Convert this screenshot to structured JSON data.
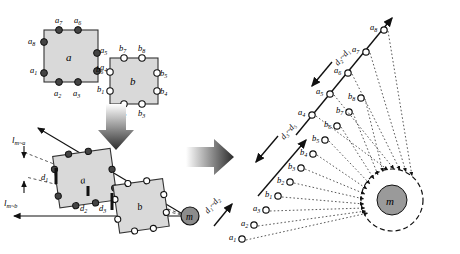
{
  "figure": {
    "background": "#ffffff",
    "fill_square": "#d9d9d9",
    "stroke": "#1a1a1a",
    "node_fill": "#8c8c8c"
  },
  "square_a": {
    "label": "a",
    "marker_style": "filled",
    "points": [
      {
        "id": "a1",
        "label": "a",
        "sub": "1"
      },
      {
        "id": "a2",
        "label": "a",
        "sub": "2"
      },
      {
        "id": "a3",
        "label": "a",
        "sub": "3"
      },
      {
        "id": "a4",
        "label": "a",
        "sub": "4"
      },
      {
        "id": "a5",
        "label": "a",
        "sub": "5"
      },
      {
        "id": "a6",
        "label": "a",
        "sub": "6"
      },
      {
        "id": "a7",
        "label": "a",
        "sub": "7"
      },
      {
        "id": "a8",
        "label": "a",
        "sub": "8"
      }
    ]
  },
  "square_b": {
    "label": "b",
    "marker_style": "hollow",
    "points": [
      {
        "id": "b1",
        "label": "b",
        "sub": "1"
      },
      {
        "id": "b2",
        "label": "b",
        "sub": "2"
      },
      {
        "id": "b3",
        "label": "b",
        "sub": "3"
      },
      {
        "id": "b4",
        "label": "b",
        "sub": "4"
      },
      {
        "id": "b5",
        "label": "b",
        "sub": "5"
      },
      {
        "id": "b6",
        "label": "b",
        "sub": "6"
      },
      {
        "id": "b7",
        "label": "b",
        "sub": "7"
      },
      {
        "id": "b8",
        "label": "b",
        "sub": "8"
      }
    ]
  },
  "middle_panel": {
    "line_labels": [
      {
        "id": "l_ma",
        "label": "l",
        "sub": "m~a",
        "arrow": "down"
      },
      {
        "id": "l_mb",
        "label": "l",
        "sub": "m~b",
        "arrow": "up"
      }
    ],
    "distance_labels": [
      {
        "id": "d1",
        "label": "d",
        "sub": "1"
      },
      {
        "id": "d2",
        "label": "d",
        "sub": "2"
      },
      {
        "id": "d3",
        "label": "d",
        "sub": "3"
      }
    ],
    "node": {
      "id": "m",
      "label": "m"
    }
  },
  "right_panel": {
    "node": {
      "id": "m",
      "label": "m"
    },
    "span_labels": [
      {
        "id": "span_d2_d1",
        "label": "d₂~d₁"
      },
      {
        "id": "span_d3_d5",
        "label": "d₃~d₅"
      },
      {
        "id": "span_d1_d2",
        "label": "d₁~d₂"
      }
    ],
    "upper_ray_points": [
      {
        "id": "a4",
        "label": "a",
        "sub": "4"
      },
      {
        "id": "a5",
        "label": "a",
        "sub": "5"
      },
      {
        "id": "a6",
        "label": "a",
        "sub": "6"
      },
      {
        "id": "a7",
        "label": "a",
        "sub": "7"
      },
      {
        "id": "a8",
        "label": "a",
        "sub": "8"
      }
    ],
    "lower_ray_points": [
      {
        "id": "a1",
        "label": "a",
        "sub": "1"
      },
      {
        "id": "a2",
        "label": "a",
        "sub": "2"
      },
      {
        "id": "a3",
        "label": "a",
        "sub": "3"
      },
      {
        "id": "b1",
        "label": "b",
        "sub": "1"
      },
      {
        "id": "b2",
        "label": "b",
        "sub": "2"
      },
      {
        "id": "b3",
        "label": "b",
        "sub": "3"
      },
      {
        "id": "b4",
        "label": "b",
        "sub": "4"
      },
      {
        "id": "b5",
        "label": "b",
        "sub": "5"
      },
      {
        "id": "b6",
        "label": "b",
        "sub": "6"
      },
      {
        "id": "b7",
        "label": "b",
        "sub": "7"
      },
      {
        "id": "b8",
        "label": "b",
        "sub": "8"
      }
    ]
  },
  "transition_arrows": [
    {
      "id": "arrow-down",
      "direction": "down"
    },
    {
      "id": "arrow-right",
      "direction": "right"
    }
  ]
}
